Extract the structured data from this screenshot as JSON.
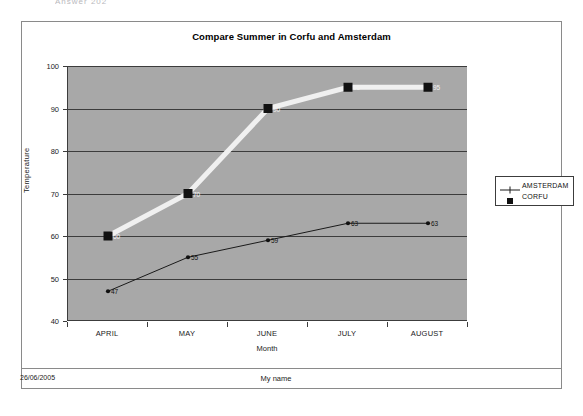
{
  "page": {
    "top_stub_text": "Answer   202",
    "footer_date": "26/06/2005",
    "footer_name": "My name"
  },
  "legend": {
    "position": "right",
    "items": [
      {
        "label": "AMSTERDAM",
        "marker": "line-plus-marker",
        "color": "#1a1a1a"
      },
      {
        "label": "CORFU",
        "marker": "filled-square",
        "color": "#111111"
      }
    ]
  },
  "chart_data": {
    "type": "line",
    "title": "Compare Summer in Corfu and Amsterdam",
    "xlabel": "Month",
    "ylabel": "Temperature",
    "categories": [
      "APRIL",
      "MAY",
      "JUNE",
      "JULY",
      "AUGUST"
    ],
    "ylim": [
      40,
      100
    ],
    "yticks": [
      40,
      50,
      60,
      70,
      80,
      90,
      100
    ],
    "grid": true,
    "plot_background": "#a8a8a8",
    "series": [
      {
        "name": "AMSTERDAM",
        "values": [
          47,
          55,
          59,
          63,
          63
        ],
        "color": "#1a1a1a",
        "line_width": 1,
        "marker": "dot",
        "label_color": "#111111"
      },
      {
        "name": "CORFU",
        "values": [
          60,
          70,
          90,
          95,
          95
        ],
        "color": "#f0f0f0",
        "line_width": 5,
        "marker": "square",
        "label_color": "#f2f2f2"
      }
    ]
  }
}
